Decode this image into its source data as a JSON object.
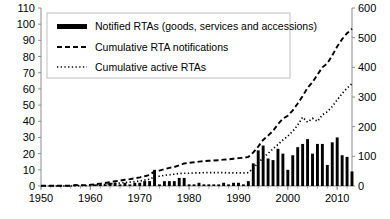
{
  "chart_data": {
    "type": "bar",
    "title": "",
    "subtitle": "",
    "xlabel": "",
    "ylabel": "",
    "y2label": "",
    "grid": false,
    "legend_position": "top-left-inside",
    "xlim": [
      1950,
      2013
    ],
    "ylim": [
      0,
      110
    ],
    "y2lim": [
      0,
      600
    ],
    "x_ticks": [
      1950,
      1960,
      1970,
      1980,
      1990,
      2000,
      2010
    ],
    "x_tick_labels": [
      "1950",
      "1960",
      "1970",
      "1980",
      "1990",
      "2000",
      "2010"
    ],
    "y_ticks": [
      0,
      10,
      20,
      30,
      40,
      50,
      60,
      70,
      80,
      90,
      100,
      110
    ],
    "y_tick_labels": [
      "0",
      "10",
      "20",
      "30",
      "40",
      "50",
      "60",
      "70",
      "80",
      "90",
      "100",
      "110"
    ],
    "y2_ticks": [
      0,
      100,
      200,
      300,
      400,
      500,
      600
    ],
    "y2_tick_labels": [
      "0",
      "100",
      "200",
      "300",
      "400",
      "500",
      "600"
    ],
    "x": [
      1950,
      1951,
      1952,
      1953,
      1954,
      1955,
      1956,
      1957,
      1958,
      1959,
      1960,
      1961,
      1962,
      1963,
      1964,
      1965,
      1966,
      1967,
      1968,
      1969,
      1970,
      1971,
      1972,
      1973,
      1974,
      1975,
      1976,
      1977,
      1978,
      1979,
      1980,
      1981,
      1982,
      1983,
      1984,
      1985,
      1986,
      1987,
      1988,
      1989,
      1990,
      1991,
      1992,
      1993,
      1994,
      1995,
      1996,
      1997,
      1998,
      1999,
      2000,
      2001,
      2002,
      2003,
      2004,
      2005,
      2006,
      2007,
      2008,
      2009,
      2010,
      2011,
      2012,
      2013
    ],
    "series": [
      {
        "name": "Notified RTAs (goods, services and accessions)",
        "type": "bar",
        "axis": "left",
        "color": "#000000",
        "values": [
          0,
          0,
          0,
          0,
          0,
          0,
          0,
          1,
          0,
          0,
          0,
          1,
          1,
          1,
          2,
          2,
          1,
          2,
          1,
          2,
          2,
          3,
          3,
          10,
          1,
          3,
          3,
          3,
          5,
          5,
          1,
          1,
          2,
          1,
          1,
          1,
          1,
          2,
          1,
          2,
          2,
          1,
          3,
          14,
          22,
          25,
          17,
          16,
          23,
          20,
          10,
          19,
          24,
          26,
          29,
          20,
          26,
          26,
          13,
          27,
          30,
          19,
          18,
          9
        ]
      },
      {
        "name": "Cumulative RTA notifications",
        "type": "line",
        "axis": "right",
        "dash": "dashed",
        "color": "#000000",
        "values": [
          1,
          1,
          1,
          1,
          1,
          1,
          1,
          3,
          3,
          3,
          4,
          6,
          8,
          10,
          13,
          16,
          18,
          21,
          23,
          26,
          29,
          33,
          37,
          50,
          52,
          57,
          61,
          64,
          70,
          76,
          78,
          80,
          82,
          84,
          85,
          86,
          87,
          89,
          90,
          92,
          94,
          95,
          98,
          113,
          133,
          155,
          170,
          186,
          208,
          227,
          237,
          255,
          278,
          303,
          331,
          350,
          375,
          400,
          413,
          440,
          470,
          495,
          515,
          530
        ]
      },
      {
        "name": "Cumulative active RTAs",
        "type": "line",
        "axis": "right",
        "dash": "dotted",
        "color": "#000000",
        "values": [
          0,
          0,
          0,
          0,
          0,
          0,
          0,
          1,
          1,
          1,
          2,
          3,
          4,
          5,
          7,
          9,
          10,
          12,
          13,
          15,
          17,
          20,
          23,
          31,
          33,
          36,
          38,
          40,
          42,
          43,
          43,
          44,
          44,
          45,
          45,
          45,
          45,
          45,
          44,
          44,
          44,
          44,
          45,
          60,
          78,
          95,
          110,
          125,
          140,
          155,
          168,
          185,
          205,
          232,
          215,
          228,
          218,
          240,
          250,
          268,
          290,
          312,
          330,
          345
        ]
      }
    ]
  },
  "legend": {
    "items": [
      {
        "label": "Notified RTAs (goods, services and accessions)",
        "marker": "thick-bar-swatch"
      },
      {
        "label": "Cumulative RTA notifications",
        "marker": "dashed-line-swatch"
      },
      {
        "label": "Cumulative active RTAs",
        "marker": "dotted-line-swatch"
      }
    ]
  },
  "colors": {
    "ink": "#000000",
    "axis": "#808080",
    "frame": "#b3b3b3",
    "background": "#ffffff"
  }
}
